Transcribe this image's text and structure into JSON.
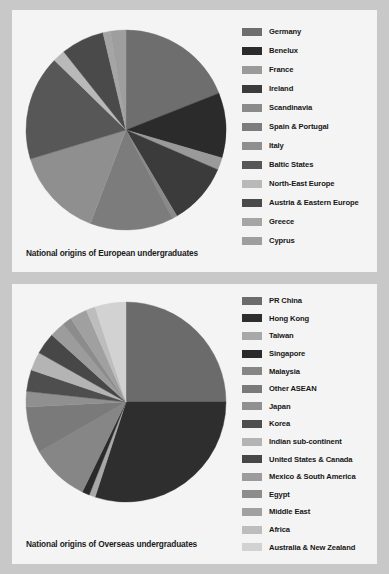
{
  "page": {
    "background_color": "#c8c8c8",
    "panel_color": "#f4f4f4"
  },
  "charts": [
    {
      "id": "european",
      "title": "National origins of European undergraduates"
    },
    {
      "id": "overseas",
      "title": "National origins of Overseas undergraduates"
    }
  ],
  "chart_data": [
    {
      "type": "pie",
      "title": "National origins of European undergraduates",
      "xlabel": "",
      "ylabel": "",
      "legend_position": "right",
      "grid": false,
      "start_angle": 0,
      "direction": "clockwise",
      "categories": [
        "Germany",
        "Benelux",
        "France",
        "Ireland",
        "Scandinavia",
        "Spain & Portugal",
        "Italy",
        "Baltic States",
        "North-East Europe",
        "Austria & Eastern Europe",
        "Greece",
        "Cyprus"
      ],
      "values": [
        19.0,
        10.5,
        2.0,
        10.0,
        0.8,
        13.5,
        14.5,
        17.0,
        2.0,
        7.0,
        1.2,
        2.5
      ],
      "colors": [
        "#6e6e6e",
        "#2b2b2b",
        "#9a9a9a",
        "#3b3b3b",
        "#8a8a8a",
        "#7c7c7c",
        "#8f8f8f",
        "#575757",
        "#b9b9b9",
        "#4a4a4a",
        "#a5a5a5",
        "#9e9e9e"
      ]
    },
    {
      "type": "pie",
      "title": "National origins of Overseas undergraduates",
      "xlabel": "",
      "ylabel": "",
      "legend_position": "right",
      "grid": false,
      "start_angle": 0,
      "direction": "clockwise",
      "categories": [
        "PR China",
        "Hong Kong",
        "Taiwan",
        "Singapore",
        "Malaysia",
        "Other ASEAN",
        "Japan",
        "Korea",
        "Indian sub-continent",
        "United States & Canada",
        "Mexico & South America",
        "Egypt",
        "Middle East",
        "Africa",
        "Australia & New Zealand"
      ],
      "values": [
        25.0,
        30.0,
        1.0,
        1.2,
        9.5,
        7.5,
        2.5,
        3.5,
        3.0,
        3.5,
        2.5,
        1.5,
        2.8,
        1.5,
        5.0
      ],
      "colors": [
        "#6b6b6b",
        "#2e2e2e",
        "#a8a8a8",
        "#2a2a2a",
        "#868686",
        "#7a7a7a",
        "#909090",
        "#4e4e4e",
        "#b4b4b4",
        "#474747",
        "#9c9c9c",
        "#8c8c8c",
        "#a0a0a0",
        "#bdbdbd",
        "#d2d2d2"
      ]
    }
  ]
}
